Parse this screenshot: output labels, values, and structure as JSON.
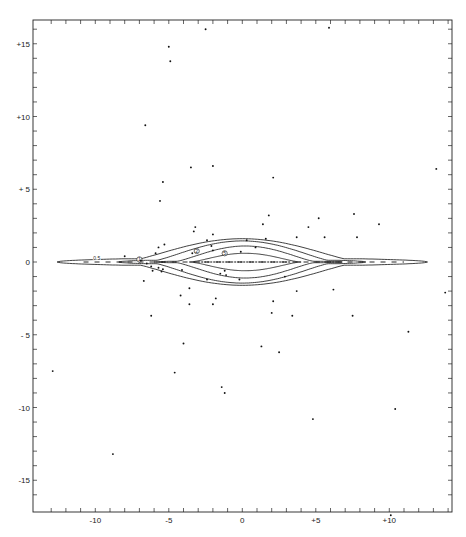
{
  "chart_data": {
    "type": "scatter",
    "title": "",
    "xlabel": "",
    "ylabel": "",
    "xlim": [
      -13.7,
      14.2
    ],
    "ylim": [
      -16.9,
      16.9
    ],
    "grid": false,
    "legend": null,
    "x_ticks": [
      {
        "value": -10,
        "label": "-10"
      },
      {
        "value": -5,
        "label": "-5"
      },
      {
        "value": 0,
        "label": "0"
      },
      {
        "value": 5,
        "label": "+5"
      },
      {
        "value": 10,
        "label": "+10"
      }
    ],
    "y_ticks": [
      {
        "value": 15,
        "label": "+15"
      },
      {
        "value": 10,
        "label": "+10"
      },
      {
        "value": 5,
        "label": "+ 5"
      },
      {
        "value": 0,
        "label": "0"
      },
      {
        "value": -5,
        "label": "- 5"
      },
      {
        "value": -10,
        "label": "-10"
      },
      {
        "value": -15,
        "label": "-15"
      }
    ],
    "minor_tick_step": 1,
    "contours": [
      {
        "level": "0.5",
        "label": "0.5",
        "half_length_left": 12.6,
        "half_length_right": 12.6,
        "center": 0.0,
        "half_height": 1.6,
        "tail_height": 0.22,
        "tail_start": 8.2,
        "label_at": [
          -9.9,
          0.25
        ],
        "circled": false
      },
      {
        "level": "1",
        "label": "1",
        "half_length_left": 8.4,
        "half_length_right": 8.4,
        "center": 0.0,
        "half_height": 1.45,
        "tail_height": 0.12,
        "tail_start": 6.5,
        "label_at": [
          -7.0,
          0.18
        ],
        "circled": true
      },
      {
        "level": "2",
        "label": "2",
        "half_length_left": 6.2,
        "half_length_right": 6.6,
        "center": 0.2,
        "half_height": 1.1,
        "tail_height": 0.05,
        "tail_start": 5.0,
        "label_at": [
          -3.1,
          0.75
        ],
        "circled": true
      },
      {
        "level": "5",
        "label": "5",
        "half_length_left": 3.8,
        "half_length_right": 3.8,
        "center": 0.2,
        "half_height": 0.6,
        "tail_height": 0.0,
        "tail_start": 3.8,
        "label_at": [
          -1.2,
          0.6
        ],
        "circled": true
      }
    ],
    "series": [
      {
        "name": "stars",
        "points": [
          [
            -2.5,
            16.0
          ],
          [
            5.9,
            16.1
          ],
          [
            -5.0,
            14.8
          ],
          [
            -4.9,
            13.8
          ],
          [
            -6.6,
            9.4
          ],
          [
            -3.5,
            6.5
          ],
          [
            -2.0,
            6.6
          ],
          [
            2.1,
            5.8
          ],
          [
            13.2,
            6.4
          ],
          [
            -5.4,
            5.5
          ],
          [
            -5.6,
            4.2
          ],
          [
            1.8,
            3.2
          ],
          [
            7.6,
            3.3
          ],
          [
            5.2,
            3.0
          ],
          [
            9.3,
            2.6
          ],
          [
            1.4,
            2.6
          ],
          [
            -3.2,
            2.4
          ],
          [
            -3.3,
            2.1
          ],
          [
            4.5,
            2.4
          ],
          [
            -2.0,
            1.9
          ],
          [
            3.7,
            1.7
          ],
          [
            5.6,
            1.7
          ],
          [
            7.8,
            1.7
          ],
          [
            -2.4,
            1.5
          ],
          [
            0.3,
            1.5
          ],
          [
            1.6,
            1.6
          ],
          [
            -5.3,
            1.2
          ],
          [
            -5.9,
            0.6
          ],
          [
            -5.7,
            1.0
          ],
          [
            -2.1,
            1.1
          ],
          [
            -2.0,
            0.8
          ],
          [
            -3.4,
            0.6
          ],
          [
            0.9,
            1.0
          ],
          [
            -0.1,
            0.7
          ],
          [
            -8.0,
            0.4
          ],
          [
            -6.9,
            0.1
          ],
          [
            -6.5,
            -0.1
          ],
          [
            -6.2,
            -0.3
          ],
          [
            -5.7,
            -0.4
          ],
          [
            -6.1,
            -0.6
          ],
          [
            -5.4,
            -0.5
          ],
          [
            -5.5,
            -0.65
          ],
          [
            -4.1,
            -0.55
          ],
          [
            -1.2,
            -0.6
          ],
          [
            -1.5,
            -0.8
          ],
          [
            -1.1,
            -0.9
          ],
          [
            -2.4,
            -1.2
          ],
          [
            -0.2,
            -1.2
          ],
          [
            2.9,
            -1.0
          ],
          [
            -6.7,
            -1.3
          ],
          [
            -3.6,
            -1.8
          ],
          [
            -4.2,
            -2.3
          ],
          [
            -1.8,
            -2.5
          ],
          [
            -2.0,
            -2.9
          ],
          [
            -3.6,
            -2.9
          ],
          [
            3.7,
            -2.0
          ],
          [
            6.2,
            -1.9
          ],
          [
            2.1,
            -2.7
          ],
          [
            2.0,
            -3.5
          ],
          [
            3.4,
            -3.7
          ],
          [
            -6.2,
            -3.7
          ],
          [
            7.5,
            -3.7
          ],
          [
            13.8,
            -2.1
          ],
          [
            11.3,
            -4.8
          ],
          [
            -4.0,
            -5.6
          ],
          [
            1.3,
            -5.8
          ],
          [
            2.5,
            -6.2
          ],
          [
            -12.9,
            -7.5
          ],
          [
            -4.6,
            -7.6
          ],
          [
            -1.4,
            -8.6
          ],
          [
            -1.2,
            -9.0
          ],
          [
            10.4,
            -10.1
          ],
          [
            4.8,
            -10.8
          ],
          [
            -8.8,
            -13.2
          ],
          [
            10.1,
            -17.4
          ]
        ]
      }
    ]
  }
}
